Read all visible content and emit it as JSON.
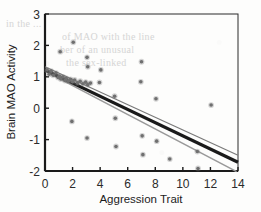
{
  "chart_data": {
    "type": "scatter",
    "title": "",
    "xlabel": "Aggression Trait",
    "ylabel": "Brain MAO Activity",
    "xlim": [
      0,
      14
    ],
    "ylim": [
      -2,
      3
    ],
    "xticks": [
      "0",
      "2",
      "4",
      "6",
      "8",
      "10",
      "12",
      "14"
    ],
    "xtick_values": [
      0,
      2,
      4,
      6,
      8,
      10,
      12,
      14
    ],
    "yticks": [
      "3",
      "2",
      "1",
      "0",
      "-1",
      "-2"
    ],
    "ytick_values": [
      3,
      2,
      1,
      0,
      -1,
      -2
    ],
    "grid": false,
    "legend": "none",
    "marker_color": "#6f6f6f",
    "points": [
      {
        "x": 0.15,
        "y": 1.22
      },
      {
        "x": 0.3,
        "y": 1.08
      },
      {
        "x": 0.45,
        "y": 1.18
      },
      {
        "x": 0.6,
        "y": 1.05
      },
      {
        "x": 0.8,
        "y": 1.12
      },
      {
        "x": 0.95,
        "y": 0.98
      },
      {
        "x": 1.05,
        "y": 1.02
      },
      {
        "x": 1.15,
        "y": 0.93
      },
      {
        "x": 1.3,
        "y": 1.0
      },
      {
        "x": 1.45,
        "y": 0.88
      },
      {
        "x": 1.55,
        "y": 0.95
      },
      {
        "x": 1.7,
        "y": 0.86
      },
      {
        "x": 1.85,
        "y": 0.92
      },
      {
        "x": 2.0,
        "y": 0.84
      },
      {
        "x": 2.15,
        "y": 0.9
      },
      {
        "x": 2.35,
        "y": 0.8
      },
      {
        "x": 2.55,
        "y": 0.86
      },
      {
        "x": 2.75,
        "y": 0.78
      },
      {
        "x": 2.95,
        "y": 0.83
      },
      {
        "x": 3.1,
        "y": 0.75
      },
      {
        "x": 3.3,
        "y": 0.8
      },
      {
        "x": 1.1,
        "y": 1.8
      },
      {
        "x": 2.05,
        "y": 2.1
      },
      {
        "x": 3.05,
        "y": 1.62
      },
      {
        "x": 3.1,
        "y": 1.32
      },
      {
        "x": 1.95,
        "y": -0.42
      },
      {
        "x": 3.05,
        "y": -0.95
      },
      {
        "x": 3.95,
        "y": 0.82
      },
      {
        "x": 4.05,
        "y": 1.22
      },
      {
        "x": 5.05,
        "y": 0.38
      },
      {
        "x": 5.1,
        "y": -0.32
      },
      {
        "x": 5.15,
        "y": -1.22
      },
      {
        "x": 6.95,
        "y": 0.84
      },
      {
        "x": 7.0,
        "y": 1.48
      },
      {
        "x": 7.05,
        "y": -0.88
      },
      {
        "x": 7.1,
        "y": -1.48
      },
      {
        "x": 8.05,
        "y": 0.3
      },
      {
        "x": 8.1,
        "y": -1.05
      },
      {
        "x": 9.05,
        "y": -1.62
      },
      {
        "x": 11.05,
        "y": -1.38
      },
      {
        "x": 11.1,
        "y": -1.92
      },
      {
        "x": 12.05,
        "y": 0.1
      }
    ],
    "lines": [
      {
        "name": "regression-line-main",
        "style": "thick-black",
        "color": "#1a1a1a",
        "width": 3.2,
        "x0": 0,
        "y0": 1.22,
        "x1": 14,
        "y1": -1.72
      },
      {
        "name": "regression-line-upper",
        "style": "thin-gray",
        "color": "#7a7a7a",
        "width": 1.2,
        "x0": 0,
        "y0": 1.32,
        "x1": 14,
        "y1": -1.5
      },
      {
        "name": "regression-line-lower",
        "style": "thin-gray",
        "color": "#9a9a9a",
        "width": 1.6,
        "x0": 0,
        "y0": 1.18,
        "x1": 13.9,
        "y1": -2.02
      }
    ]
  },
  "bleed_text": {
    "l1": "in the ...",
    "l2": "of MAO with the line",
    "l3": "ber of an unusual",
    "l4": "the sex-linked"
  }
}
